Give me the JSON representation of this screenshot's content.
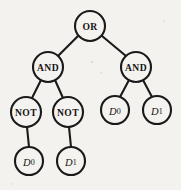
{
  "diagram": {
    "type": "binary-expression-tree",
    "background_color": "#f3f2ef",
    "stroke_color": "#1a1a1a",
    "node_fill_color": "#f4f3f0",
    "nodes": [
      {
        "id": "root",
        "label": "OR",
        "kind": "operator",
        "cx": 90,
        "cy": 26,
        "r": 15
      },
      {
        "id": "and-left",
        "label": "AND",
        "kind": "operator",
        "cx": 48,
        "cy": 67,
        "r": 15
      },
      {
        "id": "and-right",
        "label": "AND",
        "kind": "operator",
        "cx": 136,
        "cy": 67,
        "r": 15
      },
      {
        "id": "not-left",
        "label": "NOT",
        "kind": "operator",
        "cx": 26,
        "cy": 112,
        "r": 15
      },
      {
        "id": "not-right",
        "label": "NOT",
        "kind": "operator",
        "cx": 68,
        "cy": 112,
        "r": 15
      },
      {
        "id": "leaf-d0-r",
        "label": "D0",
        "kind": "variable",
        "cx": 115,
        "cy": 110,
        "r": 14
      },
      {
        "id": "leaf-d1-r",
        "label": "D1",
        "kind": "variable",
        "cx": 157,
        "cy": 110,
        "r": 14
      },
      {
        "id": "leaf-d0-l",
        "label": "D0",
        "kind": "variable",
        "cx": 29,
        "cy": 161,
        "r": 14
      },
      {
        "id": "leaf-d1-l",
        "label": "D1",
        "kind": "variable",
        "cx": 71,
        "cy": 161,
        "r": 14
      }
    ],
    "edges": [
      {
        "id": "e-root-andleft",
        "from": "root",
        "to": "and-left",
        "x1": 78,
        "y1": 36,
        "x2": 58,
        "y2": 56
      },
      {
        "id": "e-root-andright",
        "from": "root",
        "to": "and-right",
        "x1": 102,
        "y1": 36,
        "x2": 126,
        "y2": 56
      },
      {
        "id": "e-andleft-notl",
        "from": "and-left",
        "to": "not-left",
        "x1": 41,
        "y1": 80,
        "x2": 32,
        "y2": 98
      },
      {
        "id": "e-andleft-notr",
        "from": "and-left",
        "to": "not-right",
        "x1": 55,
        "y1": 80,
        "x2": 63,
        "y2": 98
      },
      {
        "id": "e-andright-d0",
        "from": "and-right",
        "to": "leaf-d0-r",
        "x1": 129,
        "y1": 80,
        "x2": 120,
        "y2": 97
      },
      {
        "id": "e-andright-d1",
        "from": "and-right",
        "to": "leaf-d1-r",
        "x1": 143,
        "y1": 80,
        "x2": 152,
        "y2": 97
      },
      {
        "id": "e-notl-d0",
        "from": "not-left",
        "to": "leaf-d0-l",
        "x1": 27,
        "y1": 127,
        "x2": 29,
        "y2": 147
      },
      {
        "id": "e-notr-d1",
        "from": "not-right",
        "to": "leaf-d1-l",
        "x1": 69,
        "y1": 127,
        "x2": 71,
        "y2": 147
      }
    ],
    "specks": [
      {
        "cx": 92,
        "cy": 62,
        "r": 0.9
      },
      {
        "cx": 101,
        "cy": 73,
        "r": 0.8
      },
      {
        "cx": 164,
        "cy": 21,
        "r": 0.7
      },
      {
        "cx": 12,
        "cy": 184,
        "r": 0.7
      }
    ]
  }
}
